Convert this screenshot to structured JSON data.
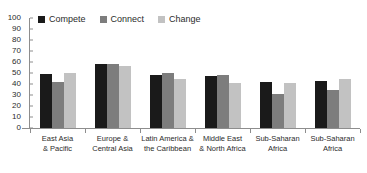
{
  "chart_data": {
    "type": "bar",
    "title": "",
    "subtitle": "",
    "xlabel": "",
    "ylabel": "",
    "ylim": [
      0,
      100
    ],
    "y_ticks": [
      100,
      90,
      80,
      70,
      60,
      50,
      40,
      30,
      20,
      10,
      0
    ],
    "grid": false,
    "legend_position": "top-left",
    "categories": [
      "East Asia\n& Pacific",
      "Europe &\nCentral Asia",
      "Latin America &\nthe Caribbean",
      "Middle East\n& North Africa",
      "Sub-Saharan\nAfrica",
      "Sub-Saharan\nAfrica"
    ],
    "category_lines": [
      [
        "East Asia",
        "& Pacific"
      ],
      [
        "Europe &",
        "Central Asia"
      ],
      [
        "Latin America &",
        "the Caribbean"
      ],
      [
        "Middle East",
        "& North Africa"
      ],
      [
        "Sub-Saharan",
        "Africa"
      ],
      [
        "Sub-Saharan",
        "Africa"
      ]
    ],
    "series": [
      {
        "name": "Compete",
        "color": "#1a1a1a",
        "values": [
          49,
          58,
          48,
          47.5,
          42,
          43
        ]
      },
      {
        "name": "Connect",
        "color": "#7d7d7d",
        "values": [
          42,
          58.5,
          50,
          48,
          30.5,
          34.5
        ]
      },
      {
        "name": "Change",
        "color": "#c2c2c2",
        "values": [
          50,
          56.5,
          44.5,
          40.5,
          40.5,
          45
        ]
      }
    ]
  },
  "legend": {
    "items": [
      {
        "label": "Compete",
        "color": "#1a1a1a"
      },
      {
        "label": "Connect",
        "color": "#7d7d7d"
      },
      {
        "label": "Change",
        "color": "#c2c2c2"
      }
    ]
  },
  "axis": {
    "y_tick_labels": [
      "100",
      "90",
      "80",
      "70",
      "60",
      "50",
      "40",
      "30",
      "20",
      "10",
      "0"
    ]
  }
}
